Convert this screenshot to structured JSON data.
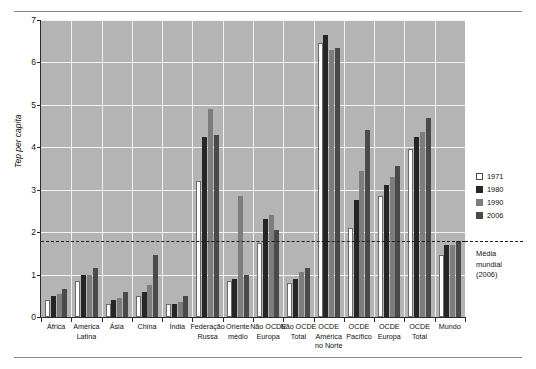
{
  "chart_data": {
    "type": "bar",
    "title": "",
    "xlabel": "",
    "ylabel": "Tep per capita",
    "ylim": [
      0,
      7
    ],
    "yticks": [
      0,
      1,
      2,
      3,
      4,
      5,
      6,
      7
    ],
    "ytick_labels": [
      "0",
      "1",
      "2",
      "3",
      "4",
      "5",
      "6",
      "7"
    ],
    "grid": true,
    "legend_position": "right",
    "categories": [
      "África",
      "América\nLatina",
      "Ásia",
      "China",
      "Índia",
      "Federação\nRussa",
      "Oriente\nmédio",
      "Não OCDE\nEuropa",
      "Não OCDE\nTotal",
      "OCDE\nAmérica\nno Norte",
      "OCDE\nPacífico",
      "OCDE\nEuropa",
      "OCDE\nTotal",
      "Mundo"
    ],
    "series": [
      {
        "name": "1971",
        "color": "#ffffff",
        "values": [
          0.4,
          0.85,
          0.3,
          0.5,
          0.3,
          3.2,
          0.85,
          1.75,
          0.8,
          6.45,
          2.1,
          2.85,
          3.95,
          1.45
        ]
      },
      {
        "name": "1980",
        "color": "#262626",
        "values": [
          0.5,
          1.0,
          0.4,
          0.6,
          0.3,
          4.25,
          0.9,
          2.3,
          0.9,
          6.65,
          2.75,
          3.1,
          4.25,
          1.7
        ]
      },
      {
        "name": "1990",
        "color": "#7d7d7d",
        "values": [
          0.55,
          1.0,
          0.45,
          0.75,
          0.35,
          4.9,
          2.85,
          2.4,
          1.05,
          6.3,
          3.45,
          3.3,
          4.35,
          1.7
        ]
      },
      {
        "name": "2006",
        "color": "#4a4a4a",
        "values": [
          0.65,
          1.15,
          0.6,
          1.45,
          0.5,
          4.3,
          1.0,
          2.05,
          1.15,
          6.35,
          4.4,
          3.55,
          4.7,
          1.8
        ]
      }
    ],
    "annotations": [
      {
        "name": "world-average-line",
        "label": "Média\nmundial\n(2006)",
        "value": 1.8,
        "style": "dashed"
      }
    ]
  },
  "legend": {
    "items": [
      {
        "label": "1971",
        "swatch": "s0"
      },
      {
        "label": "1980",
        "swatch": "s1"
      },
      {
        "label": "1990",
        "swatch": "s2"
      },
      {
        "label": "2006",
        "swatch": "s3"
      }
    ],
    "mean_label": "Média\nmundial\n(2006)"
  }
}
